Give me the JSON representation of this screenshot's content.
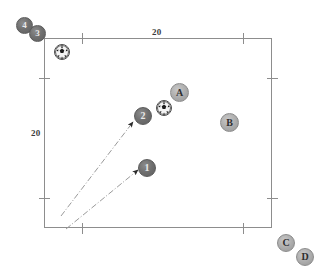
{
  "diagram": {
    "field": {
      "x": 44,
      "y": 38,
      "width": 228,
      "height": 190,
      "border_color": "#8d8d8d"
    },
    "axis_labels": [
      {
        "name": "top-scale-label",
        "text": "20",
        "x": 152,
        "y": 27
      },
      {
        "name": "left-scale-label",
        "text": "20",
        "x": 31,
        "y": 128
      }
    ],
    "ticks": {
      "top": [
        {
          "x": 82
        },
        {
          "x": 243
        }
      ],
      "bottom": [
        {
          "x": 82
        },
        {
          "x": 243
        }
      ],
      "left": [
        {
          "y": 78
        },
        {
          "y": 198
        }
      ],
      "right": [
        {
          "y": 78
        },
        {
          "y": 198
        }
      ]
    },
    "players": [
      {
        "name": "player-4",
        "label": "4",
        "team": "numbers",
        "x": 16,
        "y": 17,
        "size": 17
      },
      {
        "name": "player-3",
        "label": "3",
        "team": "numbers",
        "x": 29,
        "y": 25,
        "size": 17
      },
      {
        "name": "player-2",
        "label": "2",
        "team": "numbers",
        "x": 134,
        "y": 107,
        "size": 18
      },
      {
        "name": "player-1",
        "label": "1",
        "team": "numbers",
        "x": 138,
        "y": 159,
        "size": 18
      },
      {
        "name": "player-A",
        "label": "A",
        "team": "letters",
        "x": 170,
        "y": 83,
        "size": 19
      },
      {
        "name": "player-B",
        "label": "B",
        "team": "letters",
        "x": 220,
        "y": 113,
        "size": 19
      },
      {
        "name": "player-C",
        "label": "C",
        "team": "letters",
        "x": 277,
        "y": 234,
        "size": 18
      },
      {
        "name": "player-D",
        "label": "D",
        "team": "letters",
        "x": 296,
        "y": 248,
        "size": 18
      }
    ],
    "balls": [
      {
        "name": "ball-upper-left",
        "x": 54,
        "y": 44,
        "size": 16
      },
      {
        "name": "ball-center",
        "x": 156,
        "y": 100,
        "size": 16
      }
    ],
    "motion_arrows": [
      {
        "name": "motion-arrow-to-player-2",
        "x1": 61,
        "y1": 216,
        "x2": 133,
        "y2": 122
      },
      {
        "name": "motion-arrow-to-player-1",
        "x1": 66,
        "y1": 229,
        "x2": 138,
        "y2": 170
      }
    ],
    "colors": {
      "field_border": "#8d8d8d",
      "numbered_team": "#6f6f6f",
      "lettered_team": "#ababab",
      "arrow": "#9a9a9a",
      "label_text": "#3b3b3b"
    }
  }
}
